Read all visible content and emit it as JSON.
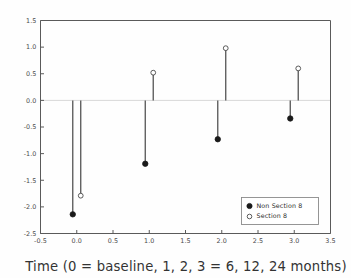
{
  "chart_data": {
    "type": "scatter",
    "title": "",
    "xlabel": "Time (0 = baseline, 1, 2, 3 = 6, 12, 24 months)",
    "ylabel": "",
    "xlim": [
      -0.5,
      3.5
    ],
    "ylim": [
      -2.5,
      1.5
    ],
    "xticks": [
      -0.5,
      0.0,
      0.5,
      1.0,
      1.5,
      2.0,
      2.5,
      3.0,
      3.5
    ],
    "xtick_labels": [
      "-0.5",
      "0.0",
      "0.5",
      "1.0",
      "1.5",
      "2.0",
      "2.5",
      "3.0",
      "3.5"
    ],
    "yticks": [
      -2.5,
      -2.0,
      -1.5,
      -1.0,
      -0.5,
      0.0,
      0.5,
      1.0,
      1.5
    ],
    "ytick_labels": [
      "-2.5",
      "-2.0",
      "-1.5",
      "-1.0",
      "-0.5",
      "0.0",
      "0.5",
      "1.0",
      "1.5"
    ],
    "grid": false,
    "zero_reference_line": 0.0,
    "legend_position": "lower right",
    "marker_offset": 0.055,
    "categories": [
      "0",
      "1",
      "2",
      "3"
    ],
    "x": [
      0,
      1,
      2,
      3
    ],
    "series": [
      {
        "name": "Non Section 8",
        "marker": "filled-circle",
        "color": "#1a1a1a",
        "values": [
          -2.14,
          -1.19,
          -0.73,
          -0.34
        ]
      },
      {
        "name": "Section 8",
        "marker": "open-circle",
        "color": "#ffffff",
        "values": [
          -1.79,
          0.52,
          0.98,
          0.6
        ]
      }
    ]
  },
  "legend": {
    "entries": [
      {
        "label": "Non Section 8",
        "marker": "filled-circle"
      },
      {
        "label": "Section 8",
        "marker": "open-circle"
      }
    ]
  },
  "axis_title": {
    "x": "Time (0 = baseline, 1, 2, 3 = 6, 12, 24 months)"
  },
  "colors": {
    "axis": "#5a5a5a",
    "stem": "#555555",
    "zero_line": "#d8d8d8",
    "filled_marker": "#1a1a1a",
    "open_marker": "#ffffff",
    "background": "#fefefe"
  }
}
